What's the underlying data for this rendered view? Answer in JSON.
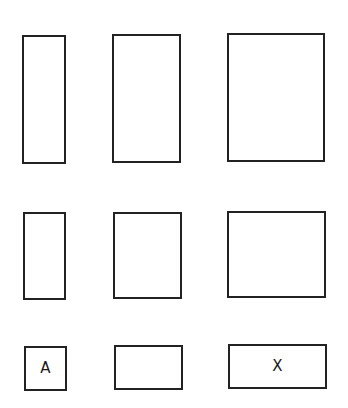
{
  "diagram": {
    "stroke_color": "#222222",
    "background": "#ffffff",
    "rows": [
      {
        "cells": [
          {
            "label": "",
            "x": 22,
            "y": 35,
            "w": 44,
            "h": 129
          },
          {
            "label": "",
            "x": 112,
            "y": 34,
            "w": 69,
            "h": 129
          },
          {
            "label": "",
            "x": 227,
            "y": 33,
            "w": 98,
            "h": 129
          }
        ]
      },
      {
        "cells": [
          {
            "label": "",
            "x": 23,
            "y": 212,
            "w": 43,
            "h": 88
          },
          {
            "label": "",
            "x": 113,
            "y": 212,
            "w": 69,
            "h": 87
          },
          {
            "label": "",
            "x": 227,
            "y": 211,
            "w": 99,
            "h": 87
          }
        ]
      },
      {
        "cells": [
          {
            "label": "A",
            "x": 24,
            "y": 346,
            "w": 43,
            "h": 45
          },
          {
            "label": "",
            "x": 114,
            "y": 345,
            "w": 69,
            "h": 45
          },
          {
            "label": "X",
            "x": 228,
            "y": 344,
            "w": 99,
            "h": 45
          }
        ]
      }
    ]
  }
}
